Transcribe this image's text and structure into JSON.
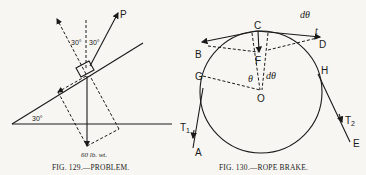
{
  "figures": [
    {
      "number": "FIG. 129.",
      "caption": "FIG. 129.—PROBLEM.",
      "labels": {
        "force": "P",
        "angle_left": "30°",
        "angle_right": "30°",
        "incline_angle": "30°",
        "weight": "60 lb. wt."
      }
    },
    {
      "number": "FIG. 130.",
      "caption": "FIG. 130.—ROPE BRAKE.",
      "labels": {
        "C": "C",
        "B": "B",
        "D": "D",
        "F": "F",
        "G": "G",
        "H": "H",
        "O": "O",
        "A": "A",
        "E": "E",
        "T1": "T",
        "T1_sub": "1",
        "T2": "T",
        "T2_sub": "2",
        "theta": "θ",
        "dtheta_center": "dθ",
        "dtheta_top": "dθ",
        "t": "t"
      }
    }
  ]
}
